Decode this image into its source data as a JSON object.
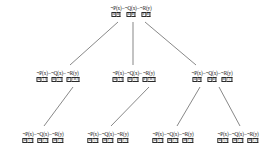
{
  "diagram": {
    "type": "resolution-proof-tree",
    "title": "",
    "nodes": [
      {
        "id": "root",
        "level": 0,
        "x": 131,
        "y": 6,
        "literals": [
          {
            "text": "¬P(x)",
            "cells": [
              "a",
              "b"
            ]
          },
          {
            "text": "¬Q(x)",
            "cells": [
              "a",
              "b"
            ]
          },
          {
            "text": "¬R(y)",
            "cells": [
              "c",
              "d"
            ]
          }
        ],
        "separators": [
          "",
          "",
          ""
        ]
      },
      {
        "id": "n1",
        "level": 1,
        "x": 58,
        "y": 71,
        "literals": [
          {
            "text": "¬P(x)",
            "cells": [
              "b",
              "{}"
            ]
          },
          {
            "text": "¬Q(x)",
            "cells": [
              "b",
              "{}"
            ]
          },
          {
            "text": "¬R(y)",
            "cells": [
              "c",
              "{d}"
            ]
          }
        ],
        "separators": [
          "",
          "",
          ""
        ]
      },
      {
        "id": "n2",
        "level": 1,
        "x": 134,
        "y": 71,
        "literals": [
          {
            "text": "¬P(x)",
            "cells": [
              "b",
              "{}"
            ]
          },
          {
            "text": "¬Q(x)",
            "cells": [
              "b",
              "{}"
            ]
          },
          {
            "text": "¬R(y)",
            "cells": [
              "c",
              "{d}"
            ]
          }
        ],
        "separators": [
          "",
          "",
          ""
        ]
      },
      {
        "id": "n3",
        "level": 1,
        "x": 212,
        "y": 71,
        "literals": [
          {
            "text": "¬P(x)",
            "cells": [
              "a",
              "b"
            ]
          },
          {
            "text": "¬Q(x)",
            "cells": [
              "a",
              "b"
            ]
          },
          {
            "text": "¬R(y)",
            "cells": [
              "d",
              "{}"
            ]
          }
        ],
        "separators": [
          "",
          "",
          ""
        ]
      },
      {
        "id": "l1",
        "level": 2,
        "x": 43,
        "y": 132,
        "literals": [
          {
            "text": "¬P(x)",
            "cells": [
              "b",
              "{}"
            ]
          },
          {
            "text": "¬Q(x)",
            "cells": [
              "b",
              "{}"
            ]
          },
          {
            "text": "¬R(y)",
            "cells": [
              "d",
              "{}"
            ]
          }
        ],
        "separators": [
          "",
          "",
          ""
        ]
      },
      {
        "id": "l2",
        "level": 2,
        "x": 108,
        "y": 132,
        "literals": [
          {
            "text": "¬P(x)",
            "cells": [
              "b",
              "{}"
            ]
          },
          {
            "text": "¬Q(x)",
            "cells": [
              "b",
              "{}"
            ]
          },
          {
            "text": "¬R(y)",
            "cells": [
              "d",
              "{}"
            ]
          }
        ],
        "separators": [
          "",
          "",
          ""
        ]
      },
      {
        "id": "l3",
        "level": 2,
        "x": 173,
        "y": 132,
        "literals": [
          {
            "text": "¬P(x)",
            "cells": [
              "b",
              "{}"
            ]
          },
          {
            "text": "¬Q(x)",
            "cells": [
              "b",
              "{}"
            ]
          },
          {
            "text": "¬R(y)",
            "cells": [
              "d",
              "{}"
            ]
          }
        ],
        "separators": [
          "",
          "",
          ""
        ]
      },
      {
        "id": "l4",
        "level": 2,
        "x": 238,
        "y": 132,
        "literals": [
          {
            "text": "¬P(x)",
            "cells": [
              "b",
              "{}"
            ]
          },
          {
            "text": "¬Q(x)",
            "cells": [
              "b",
              "{}"
            ]
          },
          {
            "text": "¬R(y)",
            "cells": [
              "d",
              "{}"
            ]
          }
        ],
        "separators": [
          "",
          "",
          ""
        ]
      }
    ],
    "edges": [
      {
        "from": "root",
        "to": "n1",
        "x1": 118,
        "y1": 22,
        "x2": 70,
        "y2": 65
      },
      {
        "from": "root",
        "to": "n2",
        "x1": 133,
        "y1": 22,
        "x2": 133,
        "y2": 65
      },
      {
        "from": "root",
        "to": "n3",
        "x1": 145,
        "y1": 22,
        "x2": 196,
        "y2": 65
      },
      {
        "from": "n1",
        "to": "l1",
        "x1": 73,
        "y1": 87,
        "x2": 44,
        "y2": 126
      },
      {
        "from": "n2",
        "to": "l2",
        "x1": 149,
        "y1": 87,
        "x2": 111,
        "y2": 126
      },
      {
        "from": "n3",
        "to": "l3",
        "x1": 200,
        "y1": 87,
        "x2": 177,
        "y2": 126
      },
      {
        "from": "n3",
        "to": "l4",
        "x1": 219,
        "y1": 87,
        "x2": 240,
        "y2": 126
      }
    ],
    "style": {
      "background": "#ffffff",
      "text_color": "#1a1a1a",
      "edge_color": "#555555",
      "box_border": "#2a2a2a"
    }
  }
}
